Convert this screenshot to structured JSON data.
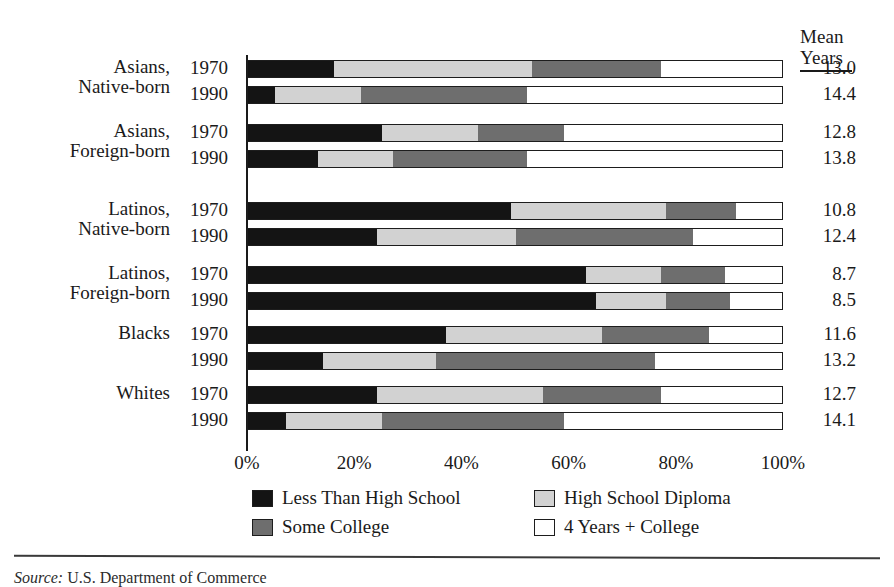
{
  "mean_header": {
    "line1": "Mean",
    "line2": "Years"
  },
  "axis": {
    "ticks": [
      "0%",
      "20%",
      "40%",
      "60%",
      "80%",
      "100%"
    ],
    "tick_values": [
      0,
      20,
      40,
      60,
      80,
      100
    ]
  },
  "legend": [
    {
      "label": "Less Than High School",
      "swatch": "black-swatch"
    },
    {
      "label": "High School Diploma",
      "swatch": "light-gray-swatch"
    },
    {
      "label": "Some College",
      "swatch": "dark-gray-swatch"
    },
    {
      "label": "4 Years + College",
      "swatch": "white-swatch"
    }
  ],
  "source": {
    "prefix": "Source:",
    "text": "U.S. Department of Commerce"
  },
  "colors": {
    "less_than_high_school": "#141414",
    "high_school_diploma": "#d2d2d2",
    "some_college": "#6e6e6e",
    "four_years_college": "#ffffff",
    "outline": "#1d1d1d"
  },
  "chart_data": {
    "type": "bar",
    "orientation": "horizontal",
    "stacked": true,
    "title": "",
    "xlabel": "",
    "ylabel": "",
    "xlim": [
      0,
      100
    ],
    "grid": false,
    "legend_position": "bottom",
    "categories": [
      "Asians, Native-born 1970",
      "Asians, Native-born 1990",
      "Asians, Foreign-born 1970",
      "Asians, Foreign-born 1990",
      "Latinos, Native-born 1970",
      "Latinos, Native-born 1990",
      "Latinos, Foreign-born 1970",
      "Latinos, Foreign-born 1990",
      "Blacks 1970",
      "Blacks 1990",
      "Whites 1970",
      "Whites 1990"
    ],
    "series": [
      {
        "name": "Less Than High School",
        "values": [
          16,
          5,
          25,
          13,
          49,
          24,
          63,
          65,
          37,
          14,
          24,
          7
        ]
      },
      {
        "name": "High School Diploma",
        "values": [
          37,
          16,
          18,
          14,
          29,
          26,
          14,
          13,
          29,
          21,
          31,
          18
        ]
      },
      {
        "name": "Some College",
        "values": [
          24,
          31,
          16,
          25,
          13,
          33,
          12,
          12,
          20,
          41,
          22,
          34
        ]
      },
      {
        "name": "4 Years + College",
        "values": [
          23,
          48,
          41,
          48,
          9,
          17,
          11,
          10,
          14,
          24,
          23,
          41
        ]
      }
    ],
    "mean_years": [
      13.0,
      14.4,
      12.8,
      13.8,
      10.8,
      12.4,
      8.7,
      8.5,
      11.6,
      13.2,
      12.7,
      14.1
    ]
  },
  "groups": [
    {
      "name_line1": "Asians,",
      "name_line2": "Native-born",
      "rows": [
        {
          "year": "1970",
          "mean": "13.0",
          "segments": [
            16,
            37,
            24,
            23
          ]
        },
        {
          "year": "1990",
          "mean": "14.4",
          "segments": [
            5,
            16,
            31,
            48
          ]
        }
      ]
    },
    {
      "name_line1": "Asians,",
      "name_line2": "Foreign-born",
      "rows": [
        {
          "year": "1970",
          "mean": "12.8",
          "segments": [
            25,
            18,
            16,
            41
          ]
        },
        {
          "year": "1990",
          "mean": "13.8",
          "segments": [
            13,
            14,
            25,
            48
          ]
        }
      ]
    },
    {
      "name_line1": "Latinos,",
      "name_line2": "Native-born",
      "rows": [
        {
          "year": "1970",
          "mean": "10.8",
          "segments": [
            49,
            29,
            13,
            9
          ]
        },
        {
          "year": "1990",
          "mean": "12.4",
          "segments": [
            24,
            26,
            33,
            17
          ]
        }
      ]
    },
    {
      "name_line1": "Latinos,",
      "name_line2": "Foreign-born",
      "rows": [
        {
          "year": "1970",
          "mean": "8.7",
          "segments": [
            63,
            14,
            12,
            11
          ]
        },
        {
          "year": "1990",
          "mean": "8.5",
          "segments": [
            65,
            13,
            12,
            10
          ]
        }
      ]
    },
    {
      "name_line1": "Blacks",
      "name_line2": "",
      "rows": [
        {
          "year": "1970",
          "mean": "11.6",
          "segments": [
            37,
            29,
            20,
            14
          ]
        },
        {
          "year": "1990",
          "mean": "13.2",
          "segments": [
            14,
            21,
            41,
            24
          ]
        }
      ]
    },
    {
      "name_line1": "Whites",
      "name_line2": "",
      "rows": [
        {
          "year": "1970",
          "mean": "12.7",
          "segments": [
            24,
            31,
            22,
            23
          ]
        },
        {
          "year": "1990",
          "mean": "14.1",
          "segments": [
            7,
            18,
            34,
            41
          ]
        }
      ]
    }
  ]
}
